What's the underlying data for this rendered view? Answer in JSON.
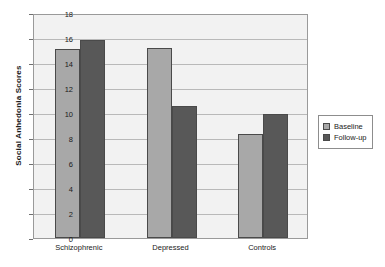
{
  "chart_data": {
    "type": "bar",
    "title": "",
    "xlabel": "",
    "ylabel": "Social Anhedonia Scores",
    "ylim": [
      0,
      18
    ],
    "ytick_step": 2,
    "yticks": [
      0,
      2,
      4,
      6,
      8,
      10,
      12,
      14,
      16,
      18
    ],
    "grid": true,
    "legend_position": "right-outside",
    "categories": [
      "Schizophrenic",
      "Depressed",
      "Controls"
    ],
    "series": [
      {
        "name": "Baseline",
        "color": "#a8a8a8",
        "values": [
          15.1,
          15.2,
          8.3
        ]
      },
      {
        "name": "Follow-up",
        "color": "#585858",
        "values": [
          15.85,
          10.6,
          9.9
        ]
      }
    ]
  },
  "legend": {
    "items": [
      {
        "label": "Baseline"
      },
      {
        "label": "Follow-up"
      }
    ]
  },
  "colors": {
    "baseline": "#a8a8a8",
    "followup": "#585858",
    "plot_background": "#f2f2f2",
    "gridline": "#b9b9b9",
    "axis": "#9a9a9a",
    "text": "#1a1a1a"
  }
}
